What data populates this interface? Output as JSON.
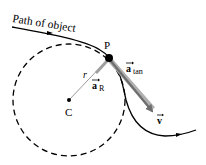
{
  "diagram": {
    "path_label": "Path of object",
    "point_label": "P",
    "center_label": "C",
    "radius_label": "r",
    "a_R": {
      "symbol": "a",
      "subscript": "R"
    },
    "a_tan": {
      "symbol": "a",
      "subscript": "tan"
    },
    "velocity": {
      "symbol": "v"
    },
    "colors": {
      "path": "#000000",
      "circle": "#000000",
      "vector_gray": "#7f7f7f",
      "radius_line": "#808080"
    }
  }
}
